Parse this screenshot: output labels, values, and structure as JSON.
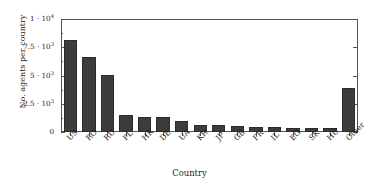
{
  "chart_data": {
    "type": "bar",
    "title": "",
    "xlabel": "Country",
    "ylabel": "No. agents per country",
    "categories": [
      "US",
      "RO",
      "RU",
      "PL",
      "HK",
      "DE",
      "UA",
      "KR",
      "JP",
      "GB",
      "FR",
      "IL",
      "EG",
      "SK",
      "HU",
      "Other"
    ],
    "values": [
      8100,
      6600,
      5050,
      1500,
      1350,
      1350,
      1000,
      600,
      580,
      560,
      420,
      400,
      380,
      360,
      350,
      3900
    ],
    "ylim": [
      0,
      10000
    ],
    "xlim_note": "categorical",
    "ytick_values": [
      0,
      2500,
      5000,
      7500,
      10000
    ],
    "ytick_labels": [
      "0",
      "2.5 · 10",
      "5 · 10",
      "7.5 · 10",
      "1 · 10"
    ],
    "ytick_exponents": [
      "",
      "3",
      "3",
      "3",
      "4"
    ],
    "grid": false,
    "legend": null,
    "bar_color": "#3c3c3c",
    "frame_color": "#555555"
  },
  "axes": {
    "y_title": "No. agents per country",
    "x_title": "Country"
  }
}
